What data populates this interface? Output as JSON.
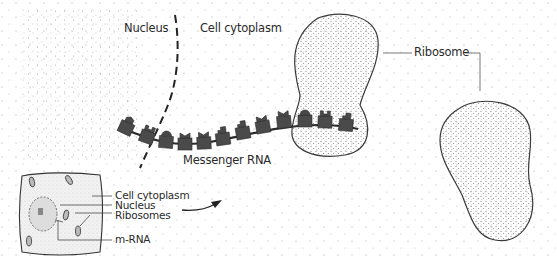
{
  "diagram": {
    "labels": {
      "nucleus": "Nucleus",
      "cell_cytoplasm": "Cell cytoplasm",
      "ribosome": "Ribosome",
      "messenger_rna": "Messenger RNA"
    },
    "inset": {
      "labels": {
        "cell_cytoplasm": "Cell cytoplasm",
        "nucleus": "Nucleus",
        "ribosomes": "Ribosomes",
        "mrna": "m-RNA"
      }
    },
    "codon_count": 13,
    "colors": {
      "codon_fill": "#4a4a4a",
      "outline": "#3a3a3a",
      "stipple": "#7a7a7a",
      "background": "#ffffff"
    }
  }
}
